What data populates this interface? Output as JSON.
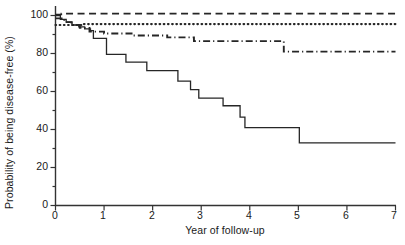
{
  "chart_data": {
    "type": "line",
    "title": "",
    "subtitle": "",
    "xlabel": "Year of follow-up",
    "ylabel": "Probability of being disease-free (%)",
    "xlim": [
      0,
      7
    ],
    "ylim": [
      0,
      105
    ],
    "xticks": [
      0,
      1,
      2,
      3,
      4,
      5,
      6,
      7
    ],
    "xtick_labels": [
      "0",
      "1",
      "2",
      "3",
      "4",
      "5",
      "6",
      "7"
    ],
    "yticks": [
      0,
      20,
      40,
      60,
      80,
      100
    ],
    "ytick_labels": [
      "0",
      "20",
      "40",
      "60",
      "80",
      "100"
    ],
    "yminor_ticks": [
      10,
      30,
      50,
      70,
      90
    ],
    "grid": false,
    "legend": "none",
    "curve_style": "kaplan-meier step",
    "series": [
      {
        "name": "curve-dashed-top",
        "style": "dashed",
        "color": "#262626",
        "points": [
          [
            0.0,
            100.5
          ],
          [
            0.12,
            100.5
          ],
          [
            0.12,
            101.0
          ],
          [
            7.0,
            101.0
          ]
        ]
      },
      {
        "name": "curve-dotted",
        "style": "dotted",
        "color": "#262626",
        "points": [
          [
            0.0,
            95.0
          ],
          [
            0.55,
            95.0
          ],
          [
            0.55,
            95.5
          ],
          [
            7.0,
            95.5
          ]
        ]
      },
      {
        "name": "curve-dash-dot",
        "style": "dash-dot",
        "color": "#262626",
        "points": [
          [
            0.0,
            98.5
          ],
          [
            0.18,
            98.5
          ],
          [
            0.18,
            96.5
          ],
          [
            0.33,
            96.5
          ],
          [
            0.33,
            95.0
          ],
          [
            0.5,
            95.0
          ],
          [
            0.5,
            93.5
          ],
          [
            0.7,
            93.5
          ],
          [
            0.7,
            91.5
          ],
          [
            1.0,
            91.5
          ],
          [
            1.0,
            90.5
          ],
          [
            1.6,
            90.5
          ],
          [
            1.6,
            89.5
          ],
          [
            2.3,
            89.5
          ],
          [
            2.3,
            88.5
          ],
          [
            2.85,
            88.5
          ],
          [
            2.85,
            86.5
          ],
          [
            4.7,
            86.5
          ],
          [
            4.7,
            81.0
          ],
          [
            7.0,
            81.0
          ]
        ]
      },
      {
        "name": "curve-solid-lowest",
        "style": "solid",
        "color": "#262626",
        "points": [
          [
            0.0,
            100.0
          ],
          [
            0.1,
            100.0
          ],
          [
            0.1,
            98.0
          ],
          [
            0.22,
            98.0
          ],
          [
            0.22,
            96.5
          ],
          [
            0.34,
            96.5
          ],
          [
            0.34,
            95.0
          ],
          [
            0.48,
            95.0
          ],
          [
            0.48,
            94.0
          ],
          [
            0.6,
            94.0
          ],
          [
            0.6,
            93.0
          ],
          [
            0.72,
            93.0
          ],
          [
            0.72,
            92.0
          ],
          [
            0.78,
            92.0
          ],
          [
            0.78,
            88.0
          ],
          [
            1.05,
            88.0
          ],
          [
            1.05,
            79.5
          ],
          [
            1.45,
            79.5
          ],
          [
            1.45,
            75.5
          ],
          [
            1.88,
            75.5
          ],
          [
            1.88,
            71.0
          ],
          [
            2.52,
            71.0
          ],
          [
            2.52,
            65.5
          ],
          [
            2.78,
            65.5
          ],
          [
            2.78,
            61.0
          ],
          [
            2.95,
            61.0
          ],
          [
            2.95,
            56.5
          ],
          [
            3.45,
            56.5
          ],
          [
            3.45,
            52.5
          ],
          [
            3.8,
            52.5
          ],
          [
            3.8,
            46.5
          ],
          [
            3.9,
            46.5
          ],
          [
            3.9,
            41.0
          ],
          [
            5.02,
            41.0
          ],
          [
            5.02,
            33.0
          ],
          [
            7.0,
            33.0
          ]
        ]
      }
    ]
  },
  "axes": {
    "x_axis_name": "Year of follow-up",
    "y_axis_name": "Probability of being disease-free (%)"
  }
}
